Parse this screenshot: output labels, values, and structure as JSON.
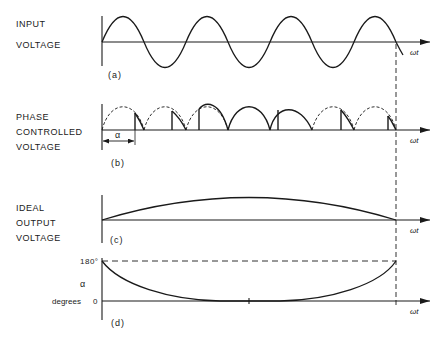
{
  "panels": {
    "a": {
      "label_line1": "INPUT",
      "label_line2": "VOLTAGE",
      "caption": "(a)",
      "axis_label": "ωt"
    },
    "b": {
      "label_line1": "PHASE",
      "label_line2": "CONTROLLED",
      "label_line3": "VOLTAGE",
      "caption": "(b)",
      "axis_label": "ωt",
      "alpha_label": "α"
    },
    "c": {
      "label_line1": "IDEAL",
      "label_line2": "OUTPUT",
      "label_line3": "VOLTAGE",
      "caption": "(c)",
      "axis_label": "ωt"
    },
    "d": {
      "y_label_top": "180°",
      "y_label_zero": "0",
      "y_label_alpha": "α",
      "y_label_unit": "degrees",
      "caption": "(d)",
      "axis_label": "ωt"
    }
  },
  "colors": {
    "ink": "#1a1a1a",
    "background": "#ffffff"
  }
}
